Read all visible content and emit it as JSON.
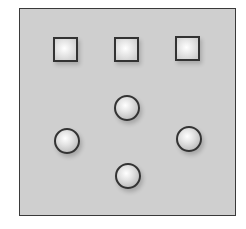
{
  "diagram": {
    "panel": {
      "fill": "#cfcfcf",
      "stroke": "#3a3a3a"
    },
    "squares": [
      {
        "id": "square-1",
        "shape": "square"
      },
      {
        "id": "square-2",
        "shape": "square"
      },
      {
        "id": "square-3",
        "shape": "square"
      }
    ],
    "spheres": [
      {
        "id": "sphere-top",
        "shape": "circle",
        "position": "top"
      },
      {
        "id": "sphere-left",
        "shape": "circle",
        "position": "left"
      },
      {
        "id": "sphere-right",
        "shape": "circle",
        "position": "right"
      },
      {
        "id": "sphere-bottom",
        "shape": "circle",
        "position": "bottom"
      }
    ]
  }
}
